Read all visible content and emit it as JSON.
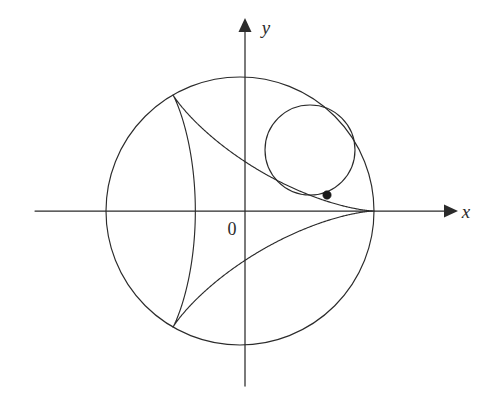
{
  "figure": {
    "background_color": "#ffffff",
    "stroke_color": "#2b2b2b",
    "labels": {
      "x_axis": "x",
      "y_axis": "y",
      "origin": "0"
    },
    "axes": {
      "x": {
        "y": 211,
        "x_start": 35,
        "x_end": 452,
        "arrow": "right"
      },
      "y": {
        "x": 245,
        "y_start": 386,
        "y_end": 22,
        "arrow": "up"
      }
    }
  },
  "chart_data": {
    "type": "line",
    "xlabel": "x",
    "ylabel": "y",
    "grid": false,
    "legend": false,
    "origin_label": "0",
    "coordinate_origin_px": [
      245,
      211
    ],
    "curves": [
      {
        "name": "fixed-circle",
        "kind": "circle",
        "center_px": [
          240,
          211
        ],
        "radius_px": 134,
        "description": "Large fixed circle of radius a"
      },
      {
        "name": "rolling-circle",
        "kind": "circle",
        "center_px": [
          310,
          150
        ],
        "radius_px": 45,
        "description": "Rolling circle of radius a/3 internally tangent to fixed circle"
      },
      {
        "name": "deltoid",
        "kind": "hypocycloid",
        "cusps": 3,
        "center_px": [
          240,
          211
        ],
        "outer_radius_px": 134,
        "rolling_radius_px": 44.667,
        "rotation_deg": 0,
        "cusp_points_px": [
          [
            374,
            211
          ],
          [
            173,
            95
          ],
          [
            173,
            327
          ]
        ],
        "description": "Deltoid traced by a point on the rolling circle"
      }
    ],
    "points": [
      {
        "name": "tracing-point",
        "px": [
          327,
          195
        ],
        "marker": "filled-circle",
        "description": "Point on rolling circle that traces the deltoid"
      }
    ]
  }
}
